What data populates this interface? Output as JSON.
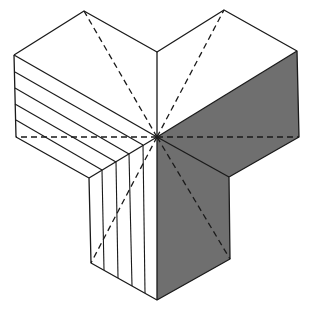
{
  "diagram": {
    "colors": {
      "line": "#1a1a1a",
      "shade": "#6f6f6f",
      "background": "#ffffff"
    },
    "center": [
      157,
      137
    ],
    "faces": {
      "top_left": "white",
      "top_right": "white",
      "left_hatched": "white-with-stripes",
      "right_shaded": "gray",
      "bottom_hatched": "white-with-vertical-stripes",
      "bottom_shaded": "gray"
    },
    "hatch_count_left": 5,
    "hatch_count_bottom": 4
  }
}
